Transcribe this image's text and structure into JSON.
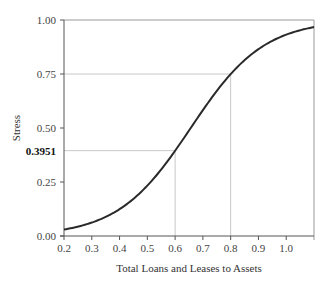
{
  "chart_data": {
    "type": "line",
    "title": "",
    "xlabel": "Total Loans and Leases to Assets",
    "ylabel": "Stress",
    "xlim": [
      0.2,
      1.1
    ],
    "ylim": [
      0.0,
      1.0
    ],
    "grid": false,
    "legend": null,
    "x_ticks": [
      "0.2",
      "0.3",
      "0.4",
      "0.5",
      "0.6",
      "0.7",
      "0.8",
      "0.9",
      "1.0"
    ],
    "y_ticks": [
      "0.00",
      "0.25",
      "0.50",
      "0.75",
      "1.00"
    ],
    "highlight_y_label": "0.3951",
    "series": [
      {
        "name": "Stress (logistic)",
        "x": [
          0.2,
          0.3,
          0.4,
          0.5,
          0.6,
          0.7,
          0.8,
          0.9,
          1.0,
          1.1
        ],
        "values": [
          0.03,
          0.066,
          0.125,
          0.24,
          0.3951,
          0.575,
          0.75,
          0.86,
          0.93,
          0.967
        ]
      }
    ],
    "annotations": [
      {
        "type": "reference-lines",
        "x": 0.6,
        "y": 0.3951,
        "label": "0.3951"
      },
      {
        "type": "reference-lines",
        "x": 0.8,
        "y": 0.75
      }
    ],
    "model": {
      "form": "logistic",
      "intercept": -5.0,
      "slope": 7.62
    }
  }
}
